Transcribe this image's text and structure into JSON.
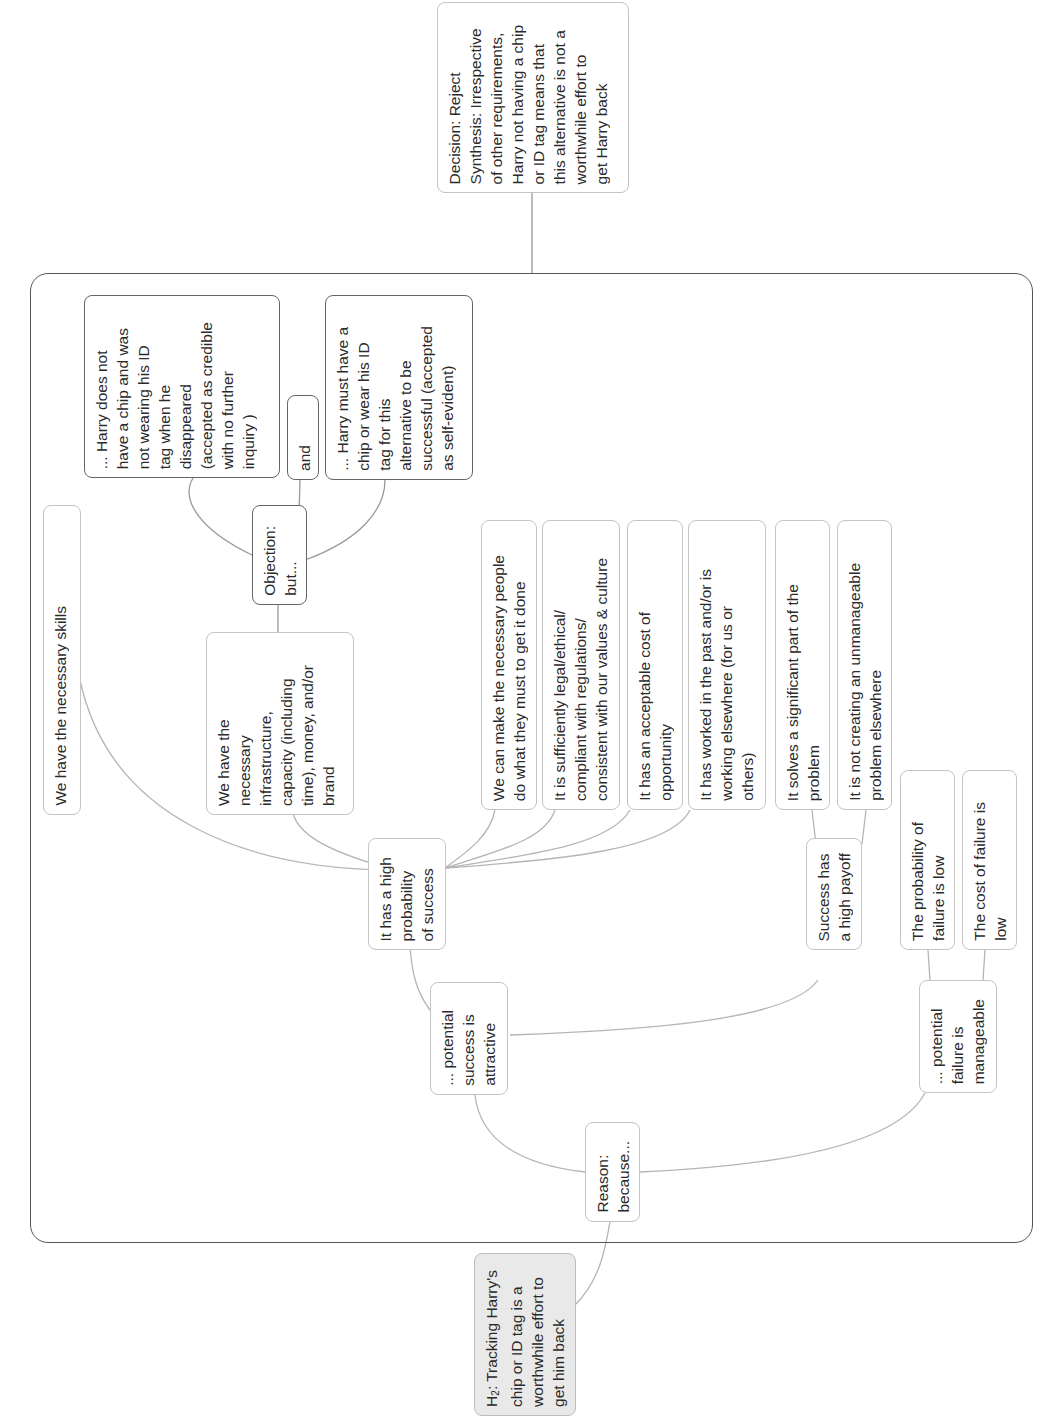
{
  "diagram": {
    "orientation": "rotated-90-ccw",
    "hypothesis": {
      "prefix": "H",
      "subscript": "2",
      "text": ": Tracking Harry's\nchip or ID tag is a\nworthwhile effort to\nget him back"
    },
    "decision": {
      "text": "Decision: Reject\nSynthesis: Irrespective\nof other requirements,\nHarry not having a chip\nor ID tag means that\nthis alternative is not a\nworthwhile effort to\nget Harry back"
    },
    "reason": {
      "text": "Reason:\nbecause..."
    },
    "success_attractive": {
      "text": "... potential\nsuccess is\nattractive"
    },
    "failure_manageable": {
      "text": "... potential\nfailure is\nmanageable"
    },
    "high_probability": {
      "text": "It has a high\nprobability\nof success"
    },
    "high_payoff": {
      "text": "Success has\na high payoff"
    },
    "prob_failure_low": {
      "text": "The probability of\nfailure is low"
    },
    "cost_failure_low": {
      "text": "The cost of failure is\nlow"
    },
    "skills": {
      "text": "We have the necessary skills"
    },
    "infrastructure": {
      "text": "We have the\nnecessary\ninfrastructure,\ncapacity (including\ntime), money, and/or\nbrand"
    },
    "people": {
      "text": "We can make the necessary people\ndo what they must to get it done"
    },
    "legal": {
      "text": "It is sufficiently legal/ethical/\ncompliant with regulations/\nconsistent with our values & culture"
    },
    "cost_opportunity": {
      "text": "It has an acceptable cost of\nopportunity"
    },
    "worked_past": {
      "text": "It has worked in the past and/or is\nworking elsewhere (for us or\nothers)"
    },
    "solves_problem": {
      "text": "It solves a significant part of the\nproblem"
    },
    "not_creating": {
      "text": "It is not creating an unmanageable\nproblem elsewhere"
    },
    "objection": {
      "text": "Objection:\nbut..."
    },
    "and_connector": {
      "text": "and"
    },
    "objection_premise_1": {
      "text": "... Harry does not\nhave a chip and was\nnot wearing his ID\ntag when he\ndisappeared\n(accepted as credible\nwith no further\ninquiry )"
    },
    "objection_premise_2": {
      "text": "... Harry must have a\nchip or wear his ID\ntag for this\nalternative to be\nsuccessful (accepted\nas self-evident)"
    }
  },
  "colors": {
    "frame_border": "#555555",
    "node_border": "#c4c4c4",
    "objection_border": "#666666",
    "hypothesis_fill": "#e9e9e9",
    "connector": "#b5b5b5"
  }
}
